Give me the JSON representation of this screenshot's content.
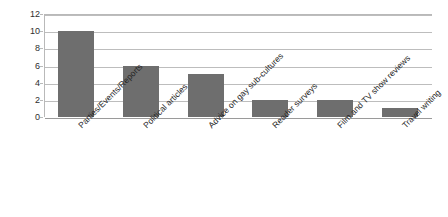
{
  "chart_data": {
    "type": "bar",
    "title": "",
    "subtitle": "",
    "xlabel": "",
    "ylabel": "",
    "categories": [
      "Parties/Events/Reports",
      "Political articles",
      "Advice on gay sub-cultures",
      "Reader surveys",
      "Film and TV show reviews",
      "Travel writing"
    ],
    "values": [
      10,
      6,
      5,
      2,
      2,
      1
    ],
    "ylim": [
      0,
      12
    ],
    "ytick_labels": [
      "0",
      "2",
      "4",
      "6",
      "8",
      "10",
      "12"
    ],
    "ytick_values": [
      0,
      2,
      4,
      6,
      8,
      10,
      12
    ],
    "grid": "horizontal",
    "legend": "none",
    "bar_color": "#6e6e6e",
    "gridline_color": "#bdbdbd",
    "axis_color": "#b9b9b9",
    "background_color": "#ffffff",
    "text_color": "#262626",
    "xlabel_rotation": "-45"
  }
}
